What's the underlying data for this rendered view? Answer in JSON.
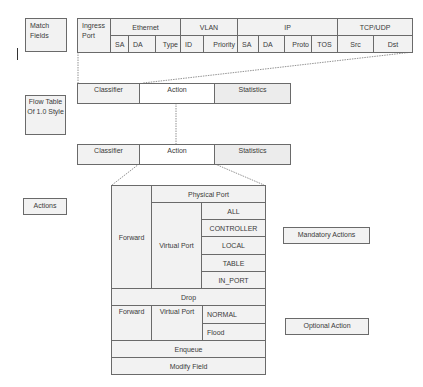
{
  "labels": {
    "match_fields": "Match Fields",
    "flow_table": "Flow Table Of 1.0 Style",
    "actions": "Actions",
    "mandatory": "Mandatory Actions",
    "optional": "Optional Action"
  },
  "match_table": {
    "groups": [
      "Ingress Port",
      "Ethernet",
      "VLAN",
      "IP",
      "TCP/UDP"
    ],
    "fields": [
      "SA",
      "DA",
      "Type",
      "ID",
      "Priority",
      "SA",
      "DA",
      "Proto",
      "TOS",
      "Src",
      "Dst"
    ]
  },
  "flow_table_1": {
    "classifier": "Classifier",
    "action": "Action",
    "statistics": "Statistics"
  },
  "flow_table_2": {
    "classifier": "Classifier",
    "action": "Action",
    "statistics": "Statistics"
  },
  "action_tree": {
    "forward": "Forward",
    "physical_port": "Physical Port",
    "virtual_port": "Virtual Port",
    "virtual_ports": [
      "ALL",
      "CONTROLLER",
      "LOCAL",
      "TABLE",
      "IN_PORT"
    ],
    "drop": "Drop",
    "opt_forward": "Forward",
    "opt_virtual_port": "Virtual Port",
    "opt_virtual_ports": [
      "NORMAL",
      "Flood"
    ],
    "enqueue": "Enqueue",
    "modify_field": "Modify Field"
  }
}
